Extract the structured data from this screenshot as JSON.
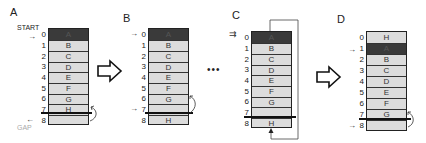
{
  "panels": [
    {
      "label": "A",
      "cells": [
        "A",
        "B",
        "C",
        "D",
        "E",
        "F",
        "G",
        "H",
        ""
      ],
      "indices": [
        "0",
        "1",
        "2",
        "3",
        "4",
        "5",
        "6",
        "7",
        "8"
      ],
      "start_label": "START",
      "gap_label": "GAP"
    },
    {
      "label": "B",
      "cells": [
        "A",
        "B",
        "C",
        "D",
        "E",
        "F",
        "G",
        "",
        "H"
      ],
      "indices": [
        "0",
        "1",
        "2",
        "3",
        "4",
        "5",
        "6",
        "7",
        "8"
      ]
    },
    {
      "label": "C",
      "cells": [
        "A",
        "B",
        "C",
        "D",
        "E",
        "F",
        "G",
        "",
        "H"
      ],
      "indices": [
        "0",
        "1",
        "2",
        "3",
        "4",
        "5",
        "6",
        "7",
        "8"
      ]
    },
    {
      "label": "D",
      "cells": [
        "H",
        "A",
        "B",
        "C",
        "D",
        "E",
        "F",
        "G",
        ""
      ],
      "indices": [
        "0",
        "1",
        "2",
        "3",
        "4",
        "5",
        "6",
        "7",
        "8"
      ]
    }
  ],
  "separators": {
    "ellipsis": "•••"
  },
  "colors": {
    "dark_cell": "#3a3a3a",
    "light_cell": "#dcdcdc",
    "line": "#111111",
    "gap_label": "#aaaaaa"
  }
}
